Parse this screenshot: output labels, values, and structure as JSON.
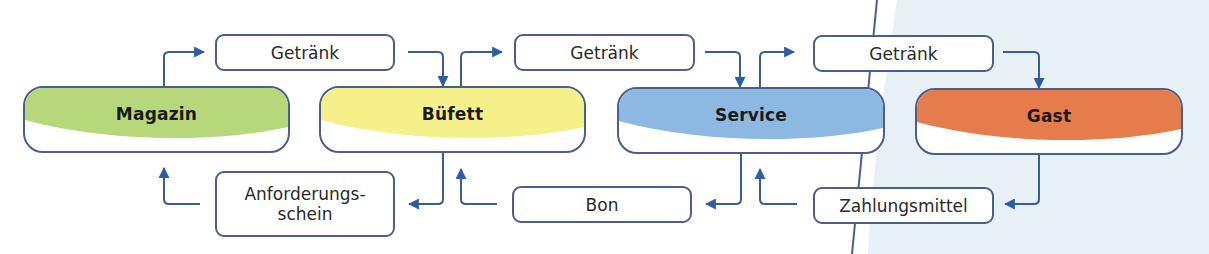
{
  "diagram": {
    "type": "flow",
    "colors": {
      "stroke": "#4a5f8c",
      "arrow": "#2c5ea8",
      "background_right": "#e7f0f5",
      "divider_line": "#4a5f8c"
    },
    "nodes": [
      {
        "id": "magazin",
        "label": "Magazin",
        "color": "#b6d77a"
      },
      {
        "id": "bufett",
        "label": "Büfett",
        "color": "#f5f08a"
      },
      {
        "id": "service",
        "label": "Service",
        "color": "#8db8e2"
      },
      {
        "id": "gast",
        "label": "Gast",
        "color": "#e67c4c"
      }
    ],
    "forward_items": [
      {
        "label": "Getränk",
        "from": "Magazin",
        "to": "Büfett"
      },
      {
        "label": "Getränk",
        "from": "Büfett",
        "to": "Service"
      },
      {
        "label": "Getränk",
        "from": "Service",
        "to": "Gast"
      }
    ],
    "backward_items": [
      {
        "label_line1": "Anforderungs-",
        "label_line2": "schein",
        "from": "Büfett",
        "to": "Magazin"
      },
      {
        "label": "Bon",
        "from": "Service",
        "to": "Büfett"
      },
      {
        "label": "Zahlungsmittel",
        "from": "Gast",
        "to": "Service"
      }
    ]
  }
}
